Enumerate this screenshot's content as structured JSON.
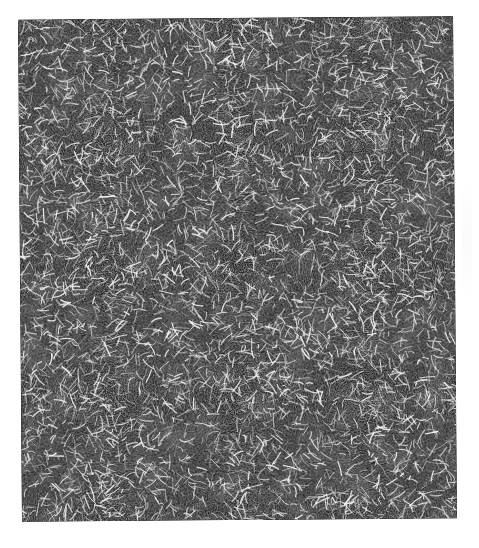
{
  "image": {
    "subject": "fibrous network micrograph",
    "description": "dense mesh of bright white fibers on dark background",
    "colors": {
      "background": "#ffffff",
      "fiber": "#f4f4f4",
      "matrix_dark": "#1c1c1c",
      "matrix_mid": "#5a5a5a"
    },
    "texture": {
      "seed": 7,
      "fiber_count": 5200,
      "fiber_min_len": 4,
      "fiber_max_len": 16
    }
  }
}
